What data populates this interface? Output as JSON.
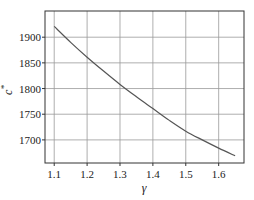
{
  "chart_data": {
    "type": "line",
    "title": "",
    "xlabel": "γ",
    "ylabel": "c*",
    "xlim": [
      1.072,
      1.677
    ],
    "ylim": [
      1655,
      1951
    ],
    "grid": true,
    "legend": null,
    "x_ticks": [
      1.1,
      1.2,
      1.3,
      1.4,
      1.5,
      1.6
    ],
    "x_tick_labels": [
      "1.1",
      "1.2",
      "1.3",
      "1.4",
      "1.5",
      "1.6"
    ],
    "y_ticks": [
      1700,
      1750,
      1800,
      1850,
      1900
    ],
    "y_tick_labels": [
      "1700",
      "1750",
      "1800",
      "1850",
      "1900"
    ],
    "series": [
      {
        "name": "c*",
        "color": "#555555",
        "x": [
          1.1,
          1.15,
          1.2,
          1.25,
          1.3,
          1.35,
          1.4,
          1.45,
          1.5,
          1.55,
          1.6,
          1.65
        ],
        "values": [
          1921,
          1890,
          1861,
          1834,
          1808,
          1784,
          1761,
          1738,
          1717,
          1700,
          1684,
          1669
        ]
      }
    ]
  },
  "colors": {
    "frame": "#333333",
    "grid": "#999999",
    "line": "#555555",
    "text": "#222222"
  }
}
